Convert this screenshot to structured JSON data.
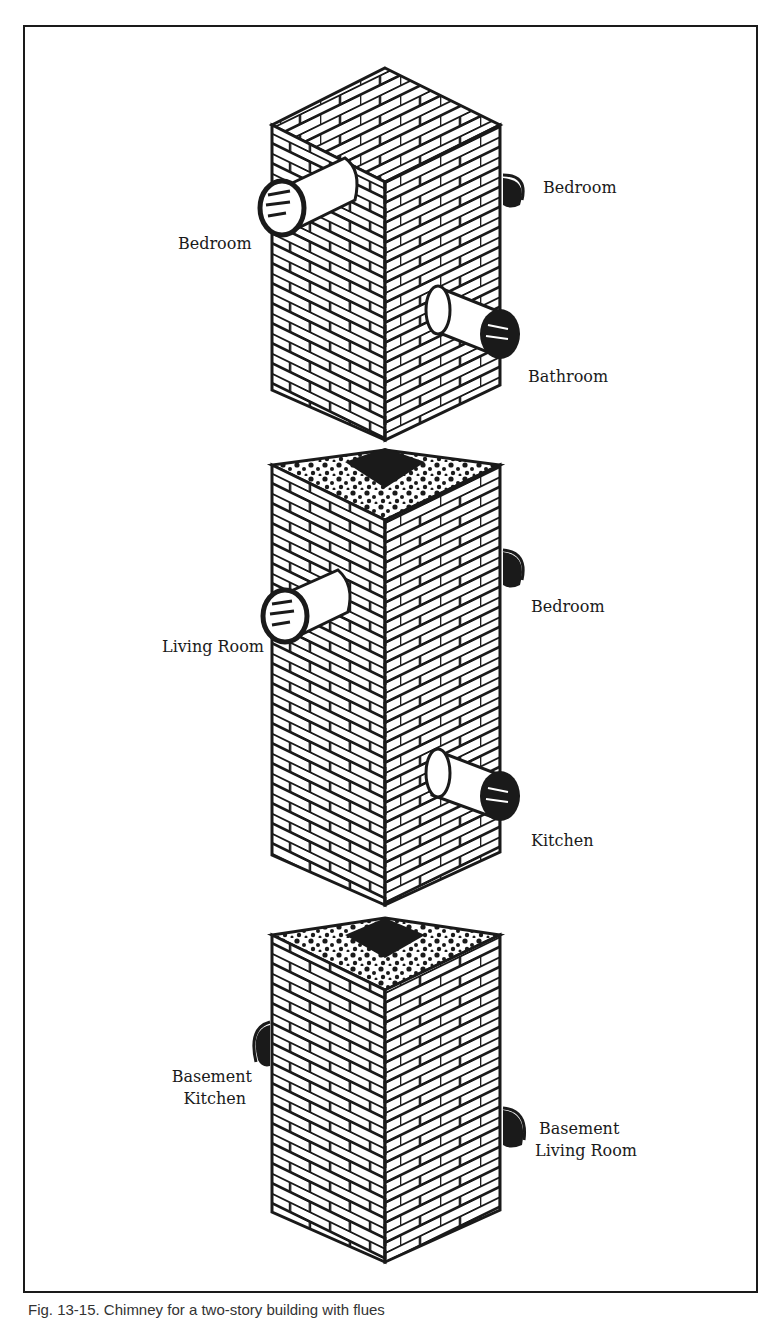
{
  "figure": {
    "caption": "Fig. 13-15. Chimney for a two-story building with flues",
    "sections": [
      {
        "name": "upper",
        "labels": [
          {
            "text": "Bedroom",
            "side": "left"
          },
          {
            "text": "Bedroom",
            "side": "right"
          },
          {
            "text": "Bathroom",
            "side": "right"
          }
        ]
      },
      {
        "name": "middle",
        "labels": [
          {
            "text": "Living Room",
            "side": "left"
          },
          {
            "text": "Bedroom",
            "side": "right"
          },
          {
            "text": "Kitchen",
            "side": "right"
          }
        ]
      },
      {
        "name": "lower",
        "labels": [
          {
            "text": "Basement",
            "line2": "Kitchen",
            "side": "left"
          },
          {
            "text": "Basement",
            "line2": "Living Room",
            "side": "right"
          }
        ]
      }
    ]
  },
  "colors": {
    "ink": "#1a1a1a",
    "paper": "#ffffff"
  }
}
